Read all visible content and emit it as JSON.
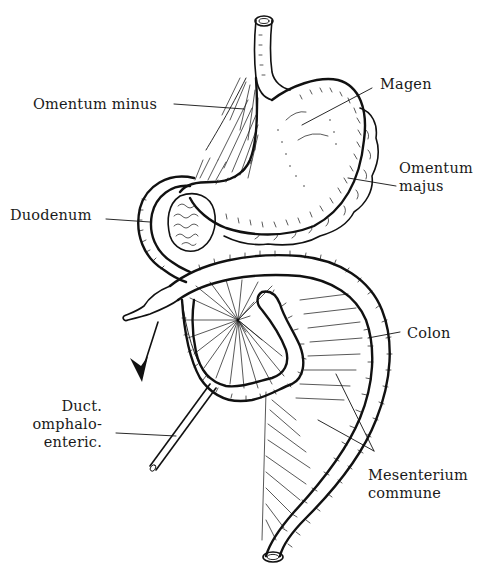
{
  "figure": {
    "type": "anatomical-diagram",
    "ink_color": "#111111",
    "background": "#ffffff"
  },
  "labels": {
    "omentum_minus": "Omentum minus",
    "magen": "Magen",
    "omentum_majus_1": "Omentum",
    "omentum_majus_2": "majus",
    "duodenum": "Duodenum",
    "colon": "Colon",
    "duct_1": "Duct.",
    "duct_2": "omphalo-",
    "duct_3": "enteric.",
    "mesenterium_1": "Mesenterium",
    "mesenterium_2": "commune"
  },
  "annotations": {
    "rotation_arrow": "arrow indicating direction of rotation"
  }
}
